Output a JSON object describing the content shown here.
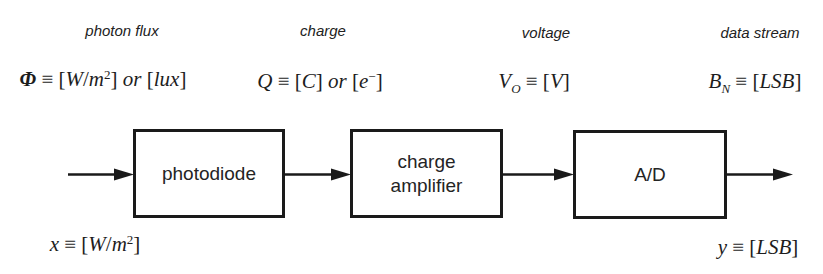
{
  "diagram": {
    "title_semantics": "photodiode signal chain block diagram",
    "colors": {
      "ink": "#1d1d1d",
      "background": "#ffffff"
    },
    "signals": [
      {
        "label": "photon flux"
      },
      {
        "label": "charge"
      },
      {
        "label": "voltage"
      },
      {
        "label": "data stream"
      }
    ],
    "blocks": [
      {
        "label": "photodiode"
      },
      {
        "label": "charge\namplifier"
      },
      {
        "label": "A/D"
      }
    ],
    "formulas": {
      "photon_flux": [
        {
          "t": "Φ",
          "s": "bi"
        },
        {
          "t": " ≡ [",
          "s": "u"
        },
        {
          "t": "W",
          "s": "i"
        },
        {
          "t": "/",
          "s": "u"
        },
        {
          "t": "m",
          "s": "i"
        },
        {
          "t": "2",
          "s": "sup"
        },
        {
          "t": "] ",
          "s": "u"
        },
        {
          "t": "or",
          "s": "i"
        },
        {
          "t": " [",
          "s": "u"
        },
        {
          "t": "lux",
          "s": "i"
        },
        {
          "t": "]",
          "s": "u"
        }
      ],
      "charge": [
        {
          "t": "Q",
          "s": "i"
        },
        {
          "t": " ≡ [",
          "s": "u"
        },
        {
          "t": "C",
          "s": "i"
        },
        {
          "t": "] ",
          "s": "u"
        },
        {
          "t": "or",
          "s": "i"
        },
        {
          "t": " [",
          "s": "u"
        },
        {
          "t": "e",
          "s": "i"
        },
        {
          "t": "−",
          "s": "sup"
        },
        {
          "t": "]",
          "s": "u"
        }
      ],
      "voltage": [
        {
          "t": "V",
          "s": "i"
        },
        {
          "t": "O",
          "s": "sub"
        },
        {
          "t": " ≡ [",
          "s": "u"
        },
        {
          "t": "V",
          "s": "i"
        },
        {
          "t": "]",
          "s": "u"
        }
      ],
      "data_stream": [
        {
          "t": "B",
          "s": "i"
        },
        {
          "t": "N",
          "s": "sub"
        },
        {
          "t": " ≡ [",
          "s": "u"
        },
        {
          "t": "LSB",
          "s": "i"
        },
        {
          "t": "]",
          "s": "u"
        }
      ],
      "input": [
        {
          "t": "x",
          "s": "i"
        },
        {
          "t": " ≡ [",
          "s": "u"
        },
        {
          "t": "W",
          "s": "i"
        },
        {
          "t": "/",
          "s": "u"
        },
        {
          "t": "m",
          "s": "i"
        },
        {
          "t": "2",
          "s": "sup"
        },
        {
          "t": "]",
          "s": "u"
        }
      ],
      "output": [
        {
          "t": "y",
          "s": "i"
        },
        {
          "t": " ≡ [",
          "s": "u"
        },
        {
          "t": "LSB",
          "s": "i"
        },
        {
          "t": "]",
          "s": "u"
        }
      ]
    }
  }
}
